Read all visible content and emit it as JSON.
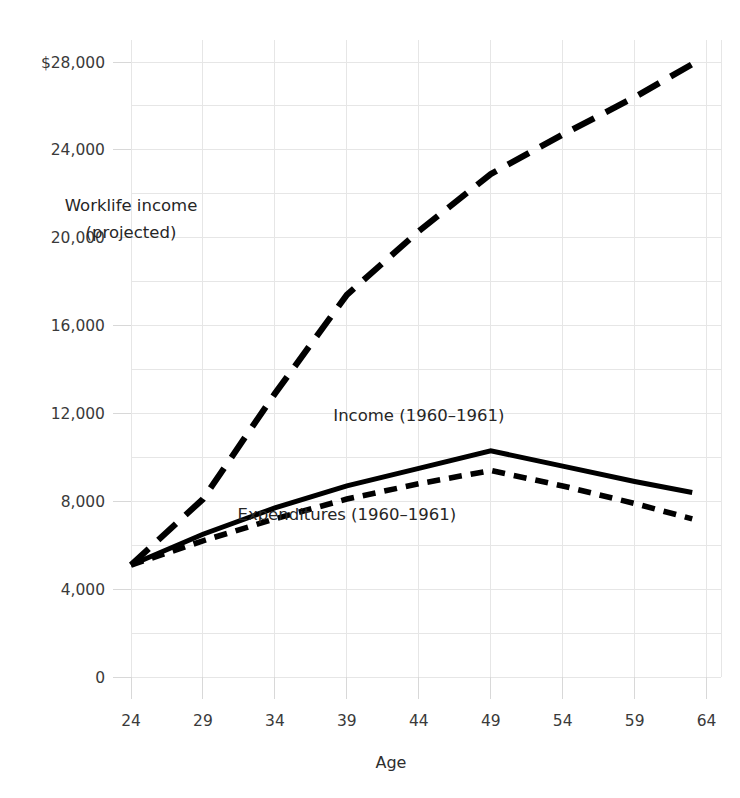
{
  "chart_data": {
    "type": "line",
    "title": "",
    "xlabel": "Age",
    "ylabel": "",
    "xlim": [
      24,
      64
    ],
    "ylim": [
      0,
      28000
    ],
    "grid": true,
    "legend_position": "inline-annotations",
    "x_ticks": [
      "24",
      "29",
      "34",
      "39",
      "44",
      "49",
      "54",
      "59",
      "64"
    ],
    "x_tick_values": [
      24,
      29,
      34,
      39,
      44,
      49,
      54,
      59,
      64
    ],
    "y_ticks": [
      "0",
      "4,000",
      "8,000",
      "12,000",
      "16,000",
      "20,000",
      "24,000",
      "$28,000"
    ],
    "y_tick_values": [
      0,
      4000,
      8000,
      12000,
      16000,
      20000,
      24000,
      28000
    ],
    "y_minor_gridline_values": [
      2000,
      6000,
      10000,
      14000,
      18000,
      22000,
      26000
    ],
    "series": [
      {
        "name": "Worklife income (projected)",
        "style": "long-dashed",
        "color": "#000000",
        "x": [
          24,
          29,
          34,
          39,
          44,
          49,
          54,
          59,
          63
        ],
        "values": [
          5100,
          8100,
          12900,
          17400,
          20300,
          22900,
          24700,
          26400,
          27900
        ]
      },
      {
        "name": "Income (1960-1961)",
        "style": "solid",
        "color": "#000000",
        "x": [
          24,
          29,
          34,
          39,
          44,
          49,
          54,
          59,
          63
        ],
        "values": [
          5100,
          6500,
          7700,
          8700,
          9500,
          10300,
          9600,
          8900,
          8400
        ]
      },
      {
        "name": "Expenditures (1960-1961)",
        "style": "short-dashed",
        "color": "#000000",
        "x": [
          24,
          29,
          34,
          39,
          44,
          49,
          54,
          59,
          63
        ],
        "values": [
          5100,
          6200,
          7200,
          8100,
          8800,
          9400,
          8700,
          7900,
          7200
        ]
      }
    ],
    "annotations": [
      {
        "id": "worklife",
        "line1": "Worklife income",
        "line2": "(projected)",
        "x": 24,
        "y": 21200
      },
      {
        "id": "income",
        "line1": "Income (1960–1961)",
        "line2": "",
        "x": 44,
        "y": 11650
      },
      {
        "id": "expenditures",
        "line1": "Expenditures (1960–1961)",
        "line2": "",
        "x": 39,
        "y": 7150
      }
    ]
  },
  "axes": {
    "x_axis_title": "Age",
    "y_axis_title": ""
  }
}
